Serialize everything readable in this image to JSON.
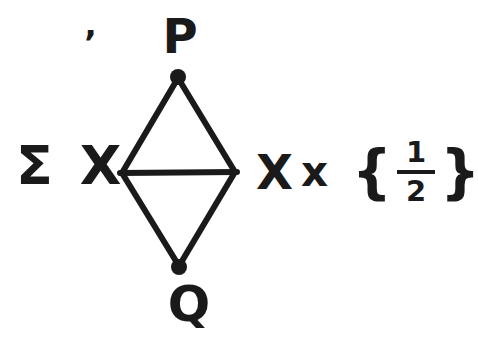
{
  "figure": {
    "background_color": "#ffffff",
    "ink_color": "#1a1a1a"
  },
  "labels": {
    "top_vertex": "P",
    "bottom_vertex": "Q",
    "left_expression": "Σ X",
    "right_expression": {
      "capital_x": "X",
      "multiply_x": "x",
      "open_brace": "{",
      "fraction_numerator": "1",
      "fraction_denominator": "2",
      "close_brace": "}"
    },
    "stray_mark": "’"
  },
  "diagram": {
    "type": "rhombus-with-horizontal-diagonal",
    "vertices": [
      {
        "id": "P",
        "position": "top",
        "dot": true
      },
      {
        "id": "left",
        "position": "left",
        "dot": false
      },
      {
        "id": "right",
        "position": "right",
        "dot": false
      },
      {
        "id": "Q",
        "position": "bottom",
        "dot": true
      }
    ],
    "edges": [
      "P-left",
      "P-right",
      "left-Q",
      "right-Q",
      "left-right"
    ]
  }
}
